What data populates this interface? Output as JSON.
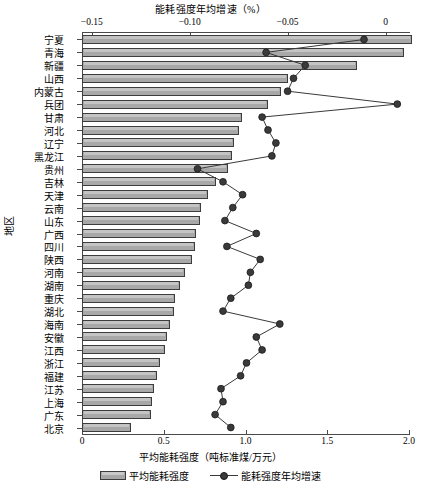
{
  "chart_data": {
    "type": "bar",
    "title": "能耗强度年均增速（%）",
    "top_axis_label": "能耗强度年均增速（%）",
    "xlabel": "平均能耗强度（吨标准煤/万元）",
    "ylabel": "地区",
    "grid": false,
    "legend_position": "bottom",
    "orientation": "horizontal",
    "bar_axis": {
      "name": "平均能耗强度（吨标准煤/万元）",
      "position": "bottom",
      "ticks": [
        "0",
        "0.5",
        "1.0",
        "1.5",
        "2.0"
      ],
      "tick_values": [
        0,
        0.5,
        1.0,
        1.5,
        2.0
      ],
      "lim": [
        0,
        2.0
      ]
    },
    "line_axis": {
      "name": "能耗强度年均增速（%）",
      "position": "top",
      "ticks": [
        "-0.15",
        "-0.10",
        "-0.05",
        "0"
      ],
      "tick_values": [
        -0.15,
        -0.1,
        -0.05,
        0
      ],
      "lim": [
        -0.155,
        0.012
      ]
    },
    "categories": [
      "宁夏",
      "青海",
      "新疆",
      "山西",
      "内蒙古",
      "兵团",
      "甘肃",
      "河北",
      "辽宁",
      "黑龙江",
      "贵州",
      "吉林",
      "天津",
      "云南",
      "山东",
      "广西",
      "四川",
      "陕西",
      "河南",
      "湖南",
      "重庆",
      "湖北",
      "海南",
      "安徽",
      "江西",
      "浙江",
      "福建",
      "江苏",
      "上海",
      "广东",
      "北京"
    ],
    "series": [
      {
        "name": "平均能耗强度",
        "type": "bar",
        "unit": "吨标准煤/万元",
        "values": [
          2.02,
          1.97,
          1.68,
          1.26,
          1.22,
          1.14,
          0.98,
          0.96,
          0.93,
          0.92,
          0.89,
          0.82,
          0.77,
          0.73,
          0.72,
          0.7,
          0.69,
          0.67,
          0.63,
          0.6,
          0.57,
          0.56,
          0.54,
          0.52,
          0.51,
          0.48,
          0.46,
          0.44,
          0.43,
          0.42,
          0.3
        ]
      },
      {
        "name": "能耗强度年均增速",
        "type": "line",
        "unit": "%",
        "values": [
          -0.011,
          -0.061,
          -0.041,
          -0.047,
          -0.05,
          0.006,
          -0.063,
          -0.06,
          -0.056,
          -0.058,
          -0.096,
          -0.083,
          -0.073,
          -0.078,
          -0.082,
          -0.066,
          -0.081,
          -0.064,
          -0.069,
          -0.07,
          -0.079,
          -0.083,
          -0.054,
          -0.066,
          -0.063,
          -0.071,
          -0.074,
          -0.084,
          -0.083,
          -0.087,
          -0.079
        ]
      }
    ],
    "colors": {
      "bar_fill": "#a8a8a8",
      "bar_edge": "#3d3d3d",
      "line": "#3a3a3a",
      "marker": "#3a3a3a",
      "axis": "#4a4a4a",
      "text": "#000000"
    }
  },
  "legend": {
    "items": [
      {
        "label": "平均能耗强度",
        "kind": "bar"
      },
      {
        "label": "能耗强度年均增速",
        "kind": "line-marker"
      }
    ]
  }
}
